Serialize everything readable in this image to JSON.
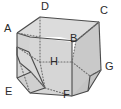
{
  "figure": {
    "kind": "truncated-cube-diagram",
    "colors": {
      "background": "#ffffff",
      "face_light": "#dcdcdc",
      "face_mid": "#d2d2d2",
      "face_dark": "#c9c9c9",
      "stroke": "#4a4a4a",
      "hidden_stroke": "#6e6e6e",
      "label": "#2b2b2b"
    },
    "stroke_width": 1.1,
    "labels": [
      {
        "id": "D",
        "text": "D",
        "x": 44,
        "y": 2,
        "anchor": "top-center"
      },
      {
        "id": "C",
        "text": "C",
        "x": 101,
        "y": 7,
        "anchor": "top-right"
      },
      {
        "id": "A",
        "text": "A",
        "x": 4,
        "y": 24,
        "anchor": "left"
      },
      {
        "id": "B",
        "text": "B",
        "x": 74,
        "y": 33,
        "anchor": "right-inner"
      },
      {
        "id": "H",
        "text": "H",
        "x": 51,
        "y": 57,
        "anchor": "center"
      },
      {
        "id": "G",
        "text": "G",
        "x": 106,
        "y": 62,
        "anchor": "right"
      },
      {
        "id": "E",
        "text": "E",
        "x": 6,
        "y": 88,
        "anchor": "bottom-left"
      },
      {
        "id": "F",
        "text": "F",
        "x": 64,
        "y": 90,
        "anchor": "bottom-center"
      }
    ],
    "vertex_points": {
      "D": [
        40,
        17
      ],
      "C": [
        99,
        22
      ],
      "A": [
        17,
        33
      ],
      "B": [
        76,
        41
      ],
      "H": [
        57,
        62
      ],
      "G": [
        101,
        70
      ],
      "E": [
        17,
        92
      ],
      "F": [
        72,
        96
      ]
    }
  }
}
